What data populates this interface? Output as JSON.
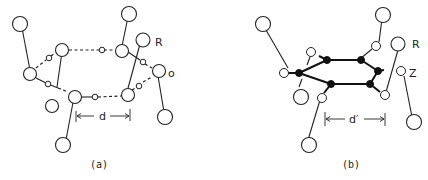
{
  "figure": {
    "panel_a": {
      "caption": "(a)",
      "labels": {
        "R": "R",
        "O": "o",
        "distance": "d"
      }
    },
    "panel_b": {
      "caption": "(b)",
      "labels": {
        "R": "R",
        "Z": "Z",
        "distance": "d′"
      }
    }
  }
}
